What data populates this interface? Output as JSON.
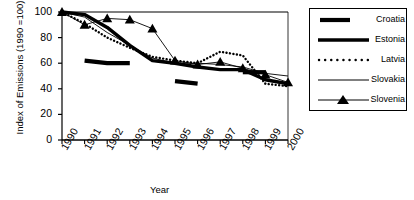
{
  "chart_data": {
    "type": "line",
    "title": "",
    "xlabel": "Year",
    "ylabel": "Index of Emissions (1990 =100)",
    "x": [
      1990,
      1991,
      1992,
      1993,
      1994,
      1995,
      1996,
      1997,
      1998,
      1999,
      2000
    ],
    "xlim": [
      1990,
      2000
    ],
    "ylim": [
      0,
      100
    ],
    "yticks": [
      0,
      20,
      40,
      60,
      80,
      100
    ],
    "xticks": [
      "1990",
      "1991",
      "1992",
      "1993",
      "1994",
      "1995",
      "1996",
      "1997",
      "1998",
      "1999",
      "2000"
    ],
    "grid": false,
    "legend_position": "right-outside",
    "series": [
      {
        "name": "Croatia",
        "style": "thick-broken",
        "values": [
          null,
          62,
          60,
          60,
          null,
          46,
          44,
          null,
          53,
          53,
          null
        ],
        "segments": [
          [
            1991,
            62
          ],
          [
            1992,
            60
          ],
          [
            1993,
            60
          ]
        ]
      },
      {
        "name": "Estonia",
        "style": "thick-solid",
        "values": [
          100,
          98,
          88,
          74,
          62,
          60,
          57,
          55,
          55,
          47,
          44
        ]
      },
      {
        "name": "Latvia",
        "style": "dotted",
        "values": [
          100,
          91,
          80,
          72,
          65,
          62,
          60,
          69,
          66,
          44,
          42
        ]
      },
      {
        "name": "Slovakia",
        "style": "thin-solid",
        "values": [
          100,
          96,
          84,
          74,
          64,
          60,
          60,
          59,
          57,
          52,
          50
        ]
      },
      {
        "name": "Slovenia",
        "style": "thin-solid-triangle",
        "values": [
          100,
          90,
          95,
          94,
          87,
          62,
          59,
          61,
          56,
          51,
          45
        ]
      }
    ]
  },
  "legend": {
    "entries": [
      {
        "label": "Croatia",
        "marker": "thick-line"
      },
      {
        "label": "Estonia",
        "marker": "thick-line-long"
      },
      {
        "label": "Latvia",
        "marker": "dotted-line"
      },
      {
        "label": "Slovakia",
        "marker": "thin-line"
      },
      {
        "label": "Slovenia",
        "marker": "thin-line-triangle"
      }
    ]
  }
}
